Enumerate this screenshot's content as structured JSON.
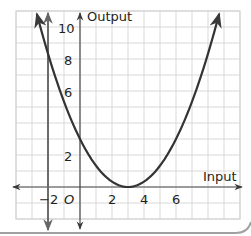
{
  "chart_data": {
    "type": "line",
    "title": "",
    "xlabel": "Input",
    "ylabel": "Output",
    "origin_label": "O",
    "x_tick_labels": [
      "−2",
      "2",
      "4",
      "6"
    ],
    "x_ticks": [
      -2,
      2,
      4,
      6
    ],
    "y_tick_labels": [
      "2",
      "6",
      "8",
      "10"
    ],
    "y_ticks": [
      2,
      6,
      8,
      10
    ],
    "xlim": [
      -4,
      10
    ],
    "ylim": [
      -2,
      11
    ],
    "grid": true,
    "grid_unit": 1,
    "legend": null,
    "series": [
      {
        "name": "parabola",
        "equation": "y = (x - 3)^2 / 3",
        "vertex": [
          3,
          0
        ],
        "x": [
          -2.7,
          -2,
          -1,
          0,
          1,
          2,
          3,
          4,
          5,
          6,
          7,
          8,
          8.7
        ],
        "values": [
          10.8,
          8.33,
          5.33,
          3,
          1.33,
          0.33,
          0,
          0.33,
          1.33,
          3,
          5.33,
          8.33,
          10.8
        ],
        "arrows_both_ends": true,
        "color": "#3a3a3a"
      },
      {
        "name": "vertical-line-x-neg2",
        "equation": "x = -2",
        "color": "#6b6b6b",
        "arrows_both_ends": true
      }
    ]
  },
  "colors": {
    "grid": "#d6d6d6",
    "axis": "#4a4a4a",
    "curve": "#333333",
    "border": "#9a9a9a"
  }
}
